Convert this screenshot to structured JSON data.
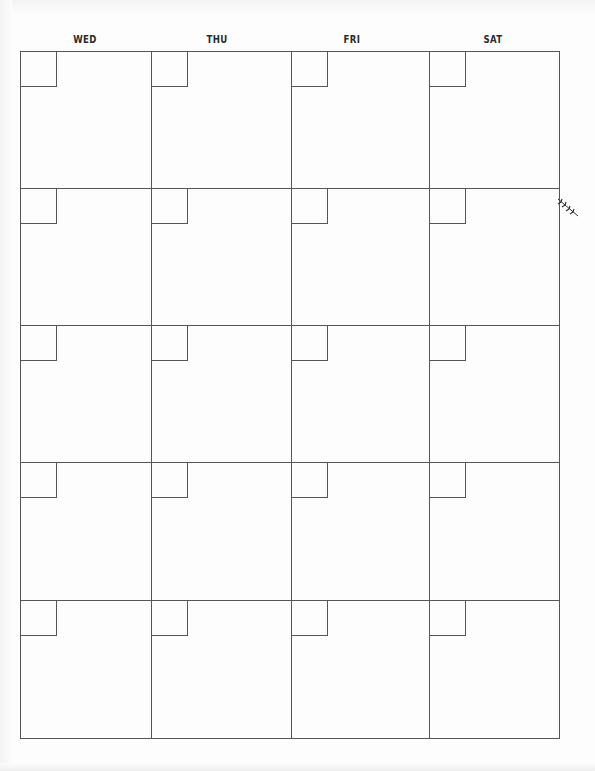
{
  "calendar": {
    "days": [
      {
        "label": "WED"
      },
      {
        "label": "THU"
      },
      {
        "label": "FRI"
      },
      {
        "label": "SAT"
      }
    ],
    "rows": 5,
    "columns": 4,
    "line_color": "#555555",
    "decoration": "leaf-sprig-icon"
  }
}
